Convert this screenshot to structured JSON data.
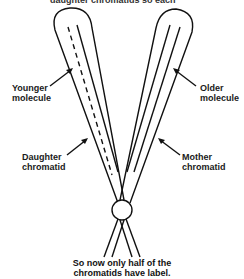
{
  "diagram": {
    "top_text_cut": "daughter chromatids so each",
    "labels": {
      "younger_molecule": [
        "Younger",
        "molecule"
      ],
      "older_molecule": [
        "Older",
        "molecule"
      ],
      "daughter_chromatid": [
        "Daughter",
        "chromatid"
      ],
      "mother_chromatid": [
        "Mother",
        "chromatid"
      ]
    },
    "caption": [
      "So now only half of the",
      "chromatids have label."
    ],
    "colors": {
      "stroke": "#111111",
      "background": "#ffffff"
    }
  }
}
